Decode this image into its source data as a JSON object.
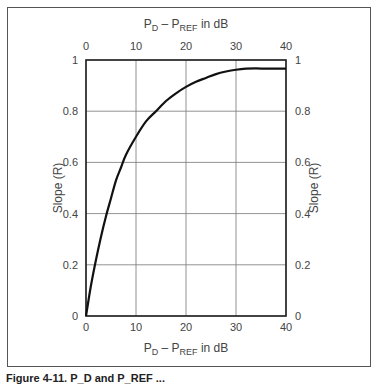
{
  "figure": {
    "caption": "Figure 4-11.  P_D and P_REF ..."
  },
  "axes": {
    "top_title": {
      "main": "P",
      "sub1": "D",
      "mid": " – P",
      "sub2": "REF",
      "tail": " in dB"
    },
    "bottom_title": {
      "main": "P",
      "sub1": "D",
      "mid": " – P",
      "sub2": "REF",
      "tail": " in dB"
    },
    "left_title": "Slope (R)",
    "right_title": "Slope (R)",
    "x_ticks": [
      "0",
      "10",
      "20",
      "30",
      "40"
    ],
    "y_ticks": [
      "0",
      "0.2",
      "0.4",
      "0.6",
      "0.8",
      "1"
    ]
  },
  "chart_data": {
    "type": "line",
    "title": "",
    "xlabel": "P_D − P_REF in dB",
    "ylabel": "Slope (R)",
    "xlim": [
      0,
      40
    ],
    "ylim": [
      0,
      1
    ],
    "grid": true,
    "x_ticks": [
      0,
      10,
      20,
      30,
      40
    ],
    "y_ticks": [
      0,
      0.2,
      0.4,
      0.6,
      0.8,
      1
    ],
    "secondary_axes": {
      "top_x": "P_D − P_REF in dB",
      "right_y": "Slope (R)"
    },
    "series": [
      {
        "name": "Slope (R)",
        "x": [
          0,
          1,
          2,
          3,
          4,
          5,
          6,
          7,
          8,
          10,
          12,
          14,
          16,
          18,
          20,
          22,
          24,
          26,
          28,
          30,
          32,
          34,
          36,
          38,
          40
        ],
        "values": [
          0.0,
          0.12,
          0.22,
          0.31,
          0.39,
          0.46,
          0.53,
          0.58,
          0.63,
          0.7,
          0.76,
          0.8,
          0.84,
          0.87,
          0.895,
          0.915,
          0.93,
          0.945,
          0.955,
          0.962,
          0.966,
          0.967,
          0.966,
          0.966,
          0.966
        ]
      }
    ]
  }
}
